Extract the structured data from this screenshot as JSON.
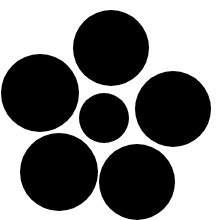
{
  "image": {
    "description": "Six solid black circles on a white background: one smaller circle in the center surrounded by five larger circles",
    "background_color": "#ffffff",
    "fill_color": "#000000",
    "circles": [
      {
        "name": "top-circle",
        "role": "outer"
      },
      {
        "name": "left-circle",
        "role": "outer"
      },
      {
        "name": "center-circle",
        "role": "center"
      },
      {
        "name": "right-circle",
        "role": "outer"
      },
      {
        "name": "bottom-left-circle",
        "role": "outer"
      },
      {
        "name": "bottom-right-circle",
        "role": "outer"
      }
    ]
  }
}
